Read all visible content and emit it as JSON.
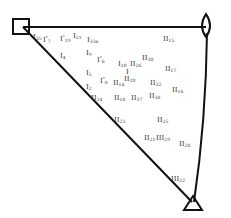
{
  "diagram": {
    "type": "ternary-triangle",
    "vertices": [
      {
        "name": "square-vertex",
        "shape": "square",
        "x": 23,
        "y": 28
      },
      {
        "name": "lens-vertex",
        "shape": "lens",
        "x": 206,
        "y": 28
      },
      {
        "name": "triangle-vertex",
        "shape": "triangle",
        "x": 193,
        "y": 204
      }
    ],
    "points": [
      {
        "id": "p1",
        "base": "I",
        "sub": "35",
        "star": false,
        "x": 33,
        "y": 34
      },
      {
        "id": "p2",
        "base": "I",
        "sub": "7",
        "star": true,
        "x": 43,
        "y": 34
      },
      {
        "id": "p3",
        "base": "I",
        "sub": "19",
        "star": true,
        "x": 60,
        "y": 33
      },
      {
        "id": "p4",
        "base": "I",
        "sub": "21",
        "star": false,
        "x": 73,
        "y": 33
      },
      {
        "id": "p5",
        "base": "I",
        "sub": "33a",
        "star": false,
        "x": 87,
        "y": 37
      },
      {
        "id": "p6",
        "base": "I",
        "sub": "4",
        "star": false,
        "x": 60,
        "y": 53
      },
      {
        "id": "p7",
        "base": "I",
        "sub": "9",
        "star": false,
        "x": 86,
        "y": 50
      },
      {
        "id": "p8",
        "base": "I",
        "sub": "6",
        "star": true,
        "x": 97,
        "y": 54
      },
      {
        "id": "p9",
        "base": "I",
        "sub": "10",
        "star": false,
        "x": 118,
        "y": 61
      },
      {
        "id": "p10",
        "base": "II",
        "sub": "26",
        "star": false,
        "x": 130,
        "y": 61
      },
      {
        "id": "p11",
        "base": "II",
        "sub": "30",
        "star": false,
        "x": 142,
        "y": 55
      },
      {
        "id": "p12",
        "base": "II",
        "sub": "15",
        "star": false,
        "x": 163,
        "y": 36
      },
      {
        "id": "p13",
        "base": "II",
        "sub": "17",
        "star": false,
        "x": 165,
        "y": 66
      },
      {
        "id": "p14",
        "base": "I",
        "sub": "5",
        "star": false,
        "x": 86,
        "y": 70
      },
      {
        "id": "p15",
        "base": "I",
        "sub": "8",
        "star": true,
        "x": 100,
        "y": 75
      },
      {
        "id": "p16",
        "base": "I",
        "sub": "",
        "star": false,
        "x": 126,
        "y": 69
      },
      {
        "id": "p17",
        "base": "II",
        "sub": "14",
        "star": false,
        "x": 113,
        "y": 80
      },
      {
        "id": "p18",
        "base": "II",
        "sub": "20",
        "star": false,
        "x": 124,
        "y": 76
      },
      {
        "id": "p19",
        "base": "I",
        "sub": "2",
        "star": false,
        "x": 86,
        "y": 84
      },
      {
        "id": "p20",
        "base": "II",
        "sub": "32",
        "star": false,
        "x": 150,
        "y": 80
      },
      {
        "id": "p21",
        "base": "II",
        "sub": "16",
        "star": false,
        "x": 172,
        "y": 87
      },
      {
        "id": "p22",
        "base": "II",
        "sub": "24",
        "star": false,
        "x": 91,
        "y": 95
      },
      {
        "id": "p23",
        "base": "II",
        "sub": "18",
        "star": false,
        "x": 114,
        "y": 95
      },
      {
        "id": "p24",
        "base": "II",
        "sub": "37",
        "star": false,
        "x": 131,
        "y": 95
      },
      {
        "id": "p25",
        "base": "II",
        "sub": "38",
        "star": false,
        "x": 149,
        "y": 93
      },
      {
        "id": "p26",
        "base": "II",
        "sub": "23",
        "star": false,
        "x": 114,
        "y": 117
      },
      {
        "id": "p27",
        "base": "II",
        "sub": "25",
        "star": false,
        "x": 157,
        "y": 117
      },
      {
        "id": "p28",
        "base": "II",
        "sub": "21",
        "star": false,
        "x": 144,
        "y": 135
      },
      {
        "id": "p29",
        "base": "III",
        "sub": "29",
        "star": false,
        "x": 156,
        "y": 135
      },
      {
        "id": "p30",
        "base": "II",
        "sub": "28",
        "star": false,
        "x": 179,
        "y": 141
      },
      {
        "id": "p31",
        "base": "III",
        "sub": "22",
        "star": false,
        "x": 171,
        "y": 176
      }
    ]
  }
}
